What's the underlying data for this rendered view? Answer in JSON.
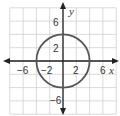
{
  "chart_data": {
    "type": "line",
    "title": "",
    "xlabel": "x",
    "ylabel": "y",
    "xlim": [
      -8,
      8
    ],
    "ylim": [
      -8,
      8
    ],
    "grid": true,
    "grid_step": 2,
    "x_ticks": [
      -6,
      -2,
      2,
      6
    ],
    "y_ticks": [
      6,
      2,
      -6
    ],
    "x_tick_labels": [
      "−6",
      "−2",
      "2",
      "6"
    ],
    "y_tick_labels": [
      "6",
      "2",
      "−6"
    ],
    "series": [
      {
        "name": "circle",
        "shape": "circle",
        "center": [
          0,
          0
        ],
        "radius": 4,
        "equation": "x^2 + y^2 = 16"
      }
    ],
    "colors": {
      "grid": "#d0d0d0",
      "axes": "#222222",
      "curve": "#555555"
    }
  }
}
